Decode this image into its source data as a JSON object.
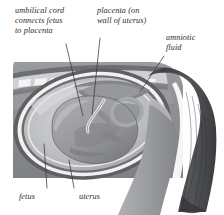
{
  "figure": {
    "labels": {
      "umbilical_cord": "umbilical cord\nconnects fetus\nto placenta",
      "placenta": "placenta (on\nwall of uterus)",
      "amniotic_fluid": "amniotic\nfluid",
      "fetus": "fetus",
      "uterus": "uterus"
    },
    "colors": {
      "page_background": "#ffffff",
      "torso_gray": "#8f9094",
      "torso_gray_dark": "#6f7074",
      "body_midtone": "#a3a4a8",
      "uterus_wall_light": "#f2f2f0",
      "uterus_wall_dark": "#5d5e62",
      "amnion_light": "#c9cacd",
      "fetus_fill": "#9a9b9f",
      "fetus_shade": "#77787c",
      "hair_dark": "#4a4b4f",
      "hair_highlight": "#ffffff",
      "skin_light": "#b8b9bc",
      "leader_line": "#37383b",
      "text": "#2a2a2a",
      "vertebra_white": "#f4f4f2"
    }
  }
}
